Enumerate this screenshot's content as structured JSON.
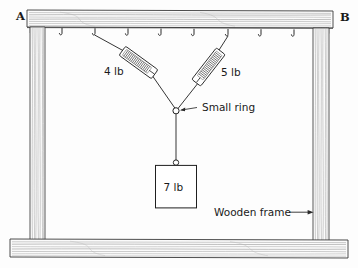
{
  "diagram": {
    "corner_labels": {
      "left": "A",
      "right": "B"
    },
    "annotations": {
      "ring": "Small ring",
      "frame": "Wooden frame"
    },
    "forces": {
      "left_scale_reading": "4 lb",
      "right_scale_reading": "5 lb",
      "hanging_weight": "7 lb"
    },
    "colors": {
      "ink": "#1a1a1a",
      "wood_grain": "#8c8c8c",
      "wood_fill": "#fbfbfb",
      "background": "#fdfdfd",
      "cord": "#2a2a2a"
    },
    "hooks": {
      "count": 8,
      "label": "ceiling-hook"
    },
    "parts": [
      {
        "name": "top-beam",
        "label": "top beam"
      },
      {
        "name": "bottom-beam",
        "label": "bottom beam"
      },
      {
        "name": "left-post",
        "label": "left post"
      },
      {
        "name": "right-post",
        "label": "right post"
      },
      {
        "name": "left-spring-scale",
        "label": "4 lb spring scale"
      },
      {
        "name": "right-spring-scale",
        "label": "5 lb spring scale"
      },
      {
        "name": "small-ring",
        "label": "small ring"
      },
      {
        "name": "weight-block",
        "label": "7 lb weight"
      }
    ]
  }
}
